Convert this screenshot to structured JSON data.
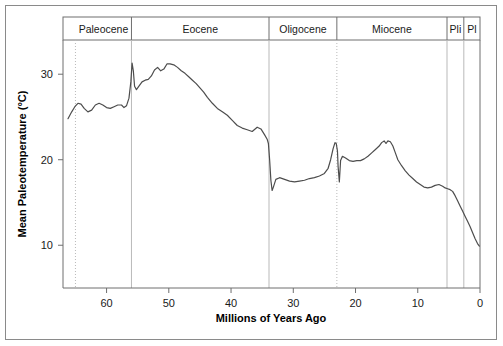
{
  "figure": {
    "background_color": "#ffffff",
    "frame_color": "#8a8a8a",
    "curve_color": "#4d4d4d",
    "axis_color": "#6e6e6e",
    "gridline_solid_color": "#b9b9b9",
    "gridline_dotted_color": "#b9b9b9"
  },
  "axes": {
    "x_title": "Millions of Years Ago",
    "y_title": "Mean Paleotemperature (°C)",
    "x_ticks": [
      60,
      50,
      40,
      30,
      20,
      10,
      0
    ],
    "y_ticks": [
      10,
      20,
      30
    ],
    "x_min": 67.0,
    "x_max": 0.0,
    "y_min": 5.0,
    "y_max": 34.0,
    "x_reversed": true,
    "grid": "epoch-boundaries-only",
    "legend": "none"
  },
  "epochs": [
    {
      "name": "Paleocene",
      "label": "Paleocene",
      "start_ma": 65.0,
      "end_ma": 56.0,
      "boundary_style_left": "dotted",
      "boundary_style_right": "solid"
    },
    {
      "name": "Eocene",
      "label": "Eocene",
      "start_ma": 56.0,
      "end_ma": 33.9,
      "boundary_style_left": "solid",
      "boundary_style_right": "solid"
    },
    {
      "name": "Oligocene",
      "label": "Oligocene",
      "start_ma": 33.9,
      "end_ma": 23.0,
      "boundary_style_left": "solid",
      "boundary_style_right": "dotted"
    },
    {
      "name": "Miocene",
      "label": "Miocene",
      "start_ma": 23.0,
      "end_ma": 5.3,
      "boundary_style_left": "dotted",
      "boundary_style_right": "solid"
    },
    {
      "name": "Pliocene",
      "label": "Pli",
      "start_ma": 5.3,
      "end_ma": 2.6,
      "boundary_style_left": "solid",
      "boundary_style_right": "solid"
    },
    {
      "name": "Pleistocene",
      "label": "Pl",
      "start_ma": 2.6,
      "end_ma": 0.0,
      "boundary_style_left": "solid",
      "boundary_style_right": "solid"
    }
  ],
  "chart_data": {
    "type": "line",
    "title": "",
    "xlabel": "Millions of Years Ago",
    "ylabel": "Mean Paleotemperature (°C)",
    "xlim": [
      67.0,
      0.0
    ],
    "ylim": [
      5.0,
      34.0
    ],
    "x_axis_reversed": true,
    "grid": false,
    "legend_position": "none",
    "series": [
      {
        "name": "Mean Paleotemperature",
        "units": "°C",
        "x": [
          66.2,
          65.6,
          65.1,
          64.6,
          64.1,
          63.6,
          63.0,
          62.4,
          61.8,
          61.2,
          60.6,
          60.0,
          59.4,
          58.8,
          58.2,
          57.6,
          57.2,
          56.8,
          56.4,
          56.1,
          55.9,
          55.7,
          55.5,
          55.2,
          54.8,
          54.3,
          53.8,
          53.3,
          52.8,
          52.3,
          51.8,
          51.3,
          50.8,
          50.3,
          49.8,
          49.2,
          48.6,
          48.0,
          47.4,
          46.8,
          46.2,
          45.6,
          45.0,
          44.4,
          43.8,
          43.0,
          42.2,
          41.4,
          40.6,
          39.8,
          39.0,
          38.2,
          37.4,
          36.6,
          35.8,
          35.2,
          34.6,
          34.2,
          34.0,
          33.8,
          33.6,
          33.4,
          33.2,
          32.8,
          32.2,
          31.4,
          30.6,
          29.8,
          29.0,
          28.2,
          27.4,
          26.6,
          25.8,
          25.0,
          24.4,
          24.0,
          23.6,
          23.3,
          23.1,
          22.9,
          22.8,
          22.6,
          22.4,
          22.1,
          21.6,
          21.0,
          20.4,
          19.8,
          19.2,
          18.6,
          18.0,
          17.4,
          16.8,
          16.2,
          15.8,
          15.4,
          15.1,
          14.8,
          14.4,
          14.0,
          13.6,
          13.2,
          12.6,
          12.0,
          11.4,
          10.8,
          10.2,
          9.6,
          9.0,
          8.4,
          7.8,
          7.2,
          6.6,
          6.0,
          5.6,
          5.2,
          4.8,
          4.4,
          4.0,
          3.6,
          3.2,
          2.8,
          2.4,
          2.0,
          1.6,
          1.2,
          0.8,
          0.4,
          0.1
        ],
        "y": [
          24.8,
          25.6,
          26.2,
          26.6,
          26.5,
          26.0,
          25.6,
          25.8,
          26.4,
          26.6,
          26.4,
          26.1,
          26.0,
          26.2,
          26.4,
          26.4,
          26.1,
          26.3,
          27.2,
          29.1,
          31.3,
          30.4,
          28.6,
          28.2,
          28.6,
          29.1,
          29.3,
          29.4,
          29.8,
          30.5,
          30.8,
          30.4,
          30.6,
          31.2,
          31.2,
          31.1,
          30.8,
          30.4,
          30.1,
          29.7,
          29.3,
          28.9,
          28.4,
          27.9,
          27.3,
          26.6,
          26.0,
          25.6,
          25.2,
          24.6,
          24.0,
          23.7,
          23.5,
          23.3,
          23.8,
          23.6,
          22.9,
          22.4,
          21.9,
          20.0,
          17.6,
          16.4,
          16.8,
          17.7,
          17.9,
          17.7,
          17.5,
          17.4,
          17.5,
          17.6,
          17.8,
          17.9,
          18.1,
          18.4,
          19.0,
          20.0,
          21.3,
          22.0,
          21.9,
          21.0,
          19.2,
          17.4,
          19.9,
          20.4,
          20.2,
          19.9,
          19.8,
          19.9,
          19.9,
          20.1,
          20.4,
          20.8,
          21.2,
          21.6,
          22.0,
          22.2,
          21.9,
          22.2,
          22.1,
          21.6,
          20.8,
          20.0,
          19.3,
          18.7,
          18.2,
          17.8,
          17.4,
          17.1,
          16.8,
          16.7,
          16.8,
          17.0,
          17.1,
          16.9,
          16.7,
          16.6,
          16.5,
          16.3,
          15.8,
          15.2,
          14.6,
          14.0,
          13.4,
          12.8,
          12.2,
          11.5,
          10.8,
          10.2,
          9.9
        ]
      }
    ],
    "annotations": [
      {
        "label": "PETM spike",
        "x_ma": 55.9,
        "y_c": 31.3
      },
      {
        "label": "Early Eocene Climatic Optimum",
        "x_ma": 50.3,
        "y_c": 31.2
      },
      {
        "label": "Eocene-Oligocene transition drop",
        "x_ma": 33.4,
        "y_c": 16.4
      },
      {
        "label": "Mi-1 glaciation dip",
        "x_ma": 22.6,
        "y_c": 17.4
      },
      {
        "label": "Miocene Climatic Optimum",
        "x_ma": 14.8,
        "y_c": 22.2
      }
    ]
  }
}
